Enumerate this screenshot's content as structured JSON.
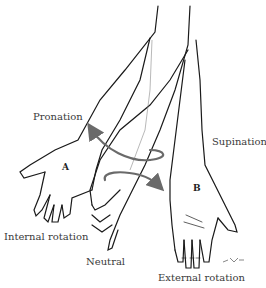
{
  "figure": {
    "labels": {
      "pronation": "Pronation",
      "supination": "Supination",
      "internal_rotation": "Internal rotation",
      "neutral": "Neutral",
      "external_rotation": "External rotation"
    },
    "hand_markers": {
      "a": "A",
      "b": "B"
    },
    "colors": {
      "line": "#1a1a1a",
      "arrow": "#6a6a6a",
      "text": "#3a3a3a",
      "background": "#ffffff"
    }
  }
}
